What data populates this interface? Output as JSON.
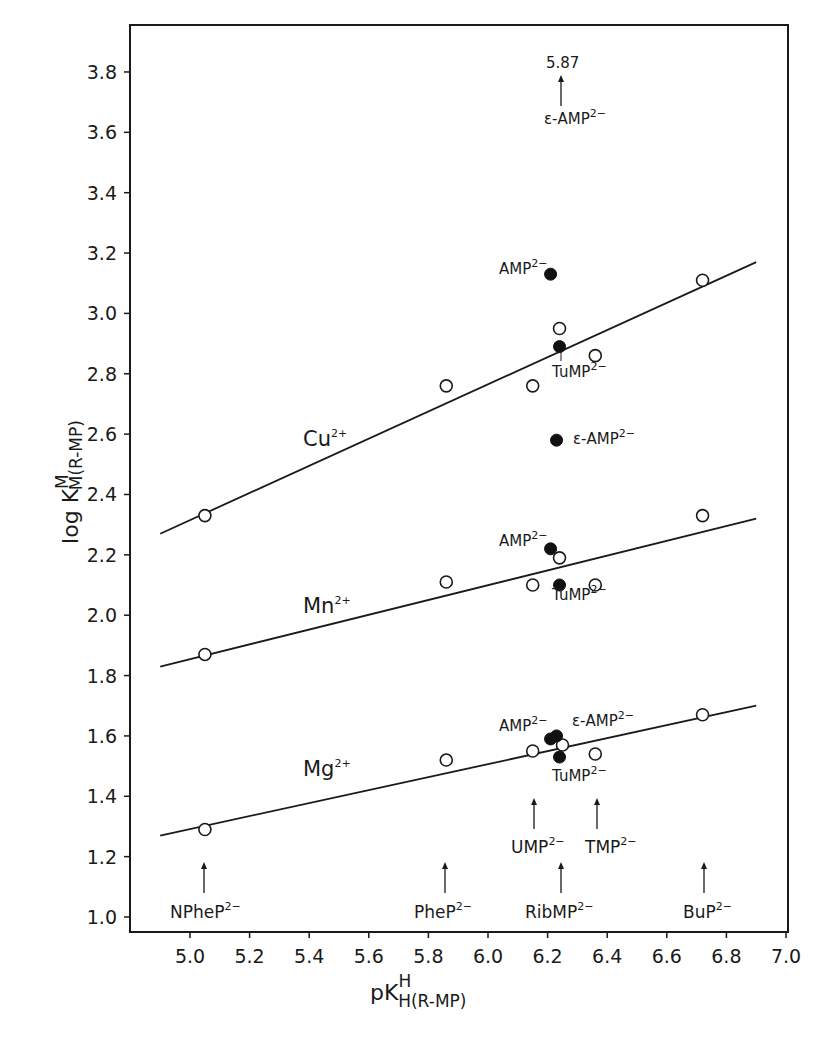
{
  "chart_data": {
    "type": "scatter",
    "title": "",
    "xlabel": "pK^H_H(R-MP)",
    "ylabel": "log K^M_M(R-MP)",
    "xlim": [
      4.83,
      7.0
    ],
    "ylim": [
      0.95,
      3.95
    ],
    "grid": false,
    "x_ticks": [
      5.0,
      5.2,
      5.4,
      5.6,
      5.8,
      6.0,
      6.2,
      6.4,
      6.6,
      6.8,
      7.0
    ],
    "x_tick_labels": [
      "5.0",
      "5.2",
      "5.4",
      "5.6",
      "5.8",
      "6.0",
      "6.2",
      "6.4",
      "6.6",
      "6.8",
      "7.0"
    ],
    "y_ticks": [
      1.0,
      1.2,
      1.4,
      1.6,
      1.8,
      2.0,
      2.2,
      2.4,
      2.6,
      2.8,
      3.0,
      3.2,
      3.4,
      3.6,
      3.8
    ],
    "y_tick_labels": [
      "1.0",
      "1.2",
      "1.4",
      "1.6",
      "1.8",
      "2.0",
      "2.2",
      "2.4",
      "2.6",
      "2.8",
      "3.0",
      "3.2",
      "3.4",
      "3.6",
      "3.8"
    ],
    "series": [
      {
        "name": "Cu2+",
        "label": "Cu",
        "label_sup": "2+",
        "label_pos": [
          5.43,
          2.52
        ],
        "regression_line": [
          [
            4.9,
            2.27
          ],
          [
            6.9,
            3.17
          ]
        ],
        "open_points": [
          [
            5.05,
            2.33
          ],
          [
            5.86,
            2.76
          ],
          [
            6.15,
            2.76
          ],
          [
            6.24,
            2.95
          ],
          [
            6.36,
            2.86
          ],
          [
            6.72,
            3.11
          ]
        ],
        "filled_points": [
          {
            "name": "AMP2-",
            "x": 6.21,
            "y": 3.13
          },
          {
            "name": "TuMP2-",
            "x": 6.24,
            "y": 2.89
          },
          {
            "name": "ε-AMP2-",
            "x": 6.23,
            "y": 2.58
          }
        ]
      },
      {
        "name": "Mn2+",
        "label": "Mn",
        "label_sup": "2+",
        "label_pos": [
          5.43,
          1.99
        ],
        "regression_line": [
          [
            4.9,
            1.83
          ],
          [
            6.9,
            2.32
          ]
        ],
        "open_points": [
          [
            5.05,
            1.87
          ],
          [
            5.86,
            2.11
          ],
          [
            6.15,
            2.1
          ],
          [
            6.24,
            2.19
          ],
          [
            6.36,
            2.1
          ],
          [
            6.72,
            2.33
          ]
        ],
        "filled_points": [
          {
            "name": "AMP2-",
            "x": 6.21,
            "y": 2.22
          },
          {
            "name": "TuMP2-",
            "x": 6.24,
            "y": 2.1
          }
        ]
      },
      {
        "name": "Mg2+",
        "label": "Mg",
        "label_sup": "2+",
        "label_pos": [
          5.43,
          1.48
        ],
        "regression_line": [
          [
            4.9,
            1.27
          ],
          [
            6.9,
            1.7
          ]
        ],
        "open_points": [
          [
            5.05,
            1.29
          ],
          [
            5.86,
            1.52
          ],
          [
            6.15,
            1.55
          ],
          [
            6.25,
            1.57
          ],
          [
            6.36,
            1.54
          ],
          [
            6.72,
            1.67
          ]
        ],
        "filled_points": [
          {
            "name": "AMP2-",
            "x": 6.21,
            "y": 1.59
          },
          {
            "name": "ε-AMP2-",
            "x": 6.23,
            "y": 1.6
          },
          {
            "name": "TuMP2-",
            "x": 6.24,
            "y": 1.53
          }
        ]
      }
    ],
    "annotations": [
      {
        "text": "5.87",
        "note": "off-scale value for Cu2+/ε-AMP2-",
        "x": 6.22,
        "y": 3.84
      },
      {
        "text": "ε-AMP",
        "sup": "2−",
        "x": 6.22,
        "y": 3.63
      },
      {
        "text": "AMP",
        "sup": "2−",
        "series": "Cu2+"
      },
      {
        "text": "TuMP",
        "sup": "2−",
        "series": "Cu2+"
      },
      {
        "text": "ε-AMP",
        "sup": "2−",
        "series": "Cu2+"
      },
      {
        "text": "AMP",
        "sup": "2−",
        "series": "Mn2+"
      },
      {
        "text": "TuMP",
        "sup": "2−",
        "series": "Mn2+"
      },
      {
        "text": "AMP",
        "sup": "2−",
        "series": "Mg2+"
      },
      {
        "text": "ε-AMP",
        "sup": "2−",
        "series": "Mg2+"
      },
      {
        "text": "TuMP",
        "sup": "2−",
        "series": "Mg2+"
      }
    ],
    "ligand_markers": [
      {
        "text": "NPheP",
        "sup": "2−",
        "x": 5.05
      },
      {
        "text": "PheP",
        "sup": "2−",
        "x": 5.86
      },
      {
        "text": "UMP",
        "sup": "2−",
        "x": 6.15
      },
      {
        "text": "TMP",
        "sup": "2−",
        "x": 6.36
      },
      {
        "text": "RibMP",
        "sup": "2−",
        "x": 6.24
      },
      {
        "text": "BuP",
        "sup": "2−",
        "x": 6.72
      }
    ]
  },
  "labels": {
    "y_axis_main": "log K",
    "y_axis_sup": "M",
    "y_axis_sub": "M(R-MP)",
    "x_axis_main": "pK",
    "x_axis_sup": "H",
    "x_axis_sub": "H(R-MP)",
    "off_scale_value": "5.87",
    "sup_2minus": "2−",
    "sup_2plus": "2+",
    "cu": "Cu",
    "mn": "Mn",
    "mg": "Mg",
    "amp": "AMP",
    "eamp": "ε-AMP",
    "tump": "TuMP",
    "npheP": "NPheP",
    "pheP": "PheP",
    "ump": "UMP",
    "tmp": "TMP",
    "ribmp": "RibMP",
    "bup": "BuP"
  }
}
